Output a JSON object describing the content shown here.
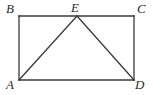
{
  "figure": {
    "kind": "geometry-diagram",
    "canvas": {
      "width": 153,
      "height": 95
    },
    "colors": {
      "background": "#ffffff",
      "stroke": "#3a3a3a",
      "label": "#2b2b2b"
    },
    "stroke_width": 1.3,
    "labels": {
      "a": "A",
      "b": "B",
      "c": "C",
      "d": "D",
      "e": "E"
    },
    "points": {
      "A": {
        "x": 19,
        "y": 80
      },
      "B": {
        "x": 19,
        "y": 16
      },
      "C": {
        "x": 134,
        "y": 16
      },
      "D": {
        "x": 134,
        "y": 80
      },
      "E": {
        "x": 77,
        "y": 16
      }
    },
    "shapes": [
      {
        "name": "rectangle-ABCD",
        "vertices": [
          "A",
          "B",
          "C",
          "D"
        ]
      },
      {
        "name": "triangle-AED",
        "vertices": [
          "A",
          "E",
          "D"
        ]
      }
    ],
    "segments": [
      {
        "name": "segment-AB",
        "from": "A",
        "to": "B"
      },
      {
        "name": "segment-BC",
        "from": "B",
        "to": "C"
      },
      {
        "name": "segment-CD",
        "from": "C",
        "to": "D"
      },
      {
        "name": "segment-DA",
        "from": "D",
        "to": "A"
      },
      {
        "name": "segment-AE",
        "from": "A",
        "to": "E"
      },
      {
        "name": "segment-ED",
        "from": "E",
        "to": "D"
      }
    ]
  }
}
